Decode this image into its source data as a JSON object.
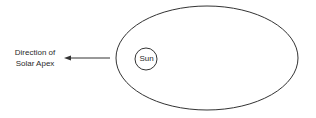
{
  "diagram": {
    "apex_label_line1": "Direction of",
    "apex_label_line2": "Solar Apex",
    "sun_label": "Sun",
    "stroke_color": "#333333",
    "background_color": "#ffffff",
    "elements": {
      "orbit_ellipse": {
        "cx": 207,
        "cy": 58,
        "rx": 91,
        "ry": 52
      },
      "sun_circle": {
        "cx": 146,
        "cy": 59,
        "r": 11
      },
      "arrow": {
        "x1": 110,
        "y1": 58,
        "x2": 65,
        "y2": 58,
        "direction": "left"
      }
    }
  }
}
